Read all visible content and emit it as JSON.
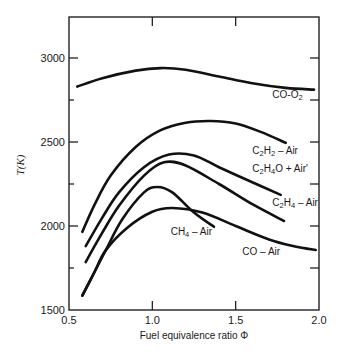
{
  "chart_data": {
    "type": "line",
    "title": "",
    "xlabel": "Fuel equivalence ratio Φ",
    "ylabel": "T(K)",
    "xlim": [
      0.5,
      2.0
    ],
    "ylim": [
      1500,
      3200
    ],
    "x_ticks": [
      {
        "value": 0.5,
        "label": "0.5"
      },
      {
        "value": 1.0,
        "label": "1.0"
      },
      {
        "value": 1.5,
        "label": "1.5"
      },
      {
        "value": 2.0,
        "label": "2.0"
      }
    ],
    "x_minor_ticks": [],
    "y_ticks": [
      {
        "value": 1500,
        "label": "1500"
      },
      {
        "value": 2000,
        "label": "2000"
      },
      {
        "value": 2500,
        "label": "2500"
      },
      {
        "value": 3000,
        "label": "3000"
      }
    ],
    "y_minor_ticks": [
      1750,
      2250,
      2750
    ],
    "grid": false,
    "legend": "none (curves labeled inline)",
    "series": [
      {
        "name": "CO-O₂",
        "label_parts": [
          [
            "CO-O",
            ""
          ],
          [
            "2",
            "sub"
          ]
        ],
        "label_at": [
          1.72,
          2760
        ],
        "points": [
          [
            0.55,
            2830
          ],
          [
            0.7,
            2880
          ],
          [
            0.9,
            2925
          ],
          [
            1.05,
            2940
          ],
          [
            1.2,
            2930
          ],
          [
            1.4,
            2890
          ],
          [
            1.6,
            2850
          ],
          [
            1.8,
            2822
          ],
          [
            1.97,
            2812
          ]
        ]
      },
      {
        "name": "C₂H₂ – Air",
        "label_parts": [
          [
            "C",
            ""
          ],
          [
            "2",
            "sub"
          ],
          [
            "H",
            ""
          ],
          [
            "2",
            "sub"
          ],
          [
            " – Air",
            ""
          ]
        ],
        "label_at": [
          1.6,
          2430
        ],
        "points": [
          [
            0.58,
            1965
          ],
          [
            0.65,
            2120
          ],
          [
            0.75,
            2300
          ],
          [
            0.9,
            2470
          ],
          [
            1.05,
            2570
          ],
          [
            1.2,
            2615
          ],
          [
            1.35,
            2625
          ],
          [
            1.5,
            2610
          ],
          [
            1.65,
            2560
          ],
          [
            1.8,
            2495
          ]
        ]
      },
      {
        "name": "C₂H₄O + Air'",
        "label_parts": [
          [
            "C",
            ""
          ],
          [
            "2",
            "sub"
          ],
          [
            "H",
            ""
          ],
          [
            "4",
            "sub"
          ],
          [
            "O + Air'",
            ""
          ]
        ],
        "label_at": [
          1.6,
          2320
        ],
        "points": [
          [
            0.6,
            1880
          ],
          [
            0.7,
            2050
          ],
          [
            0.8,
            2200
          ],
          [
            0.95,
            2350
          ],
          [
            1.1,
            2425
          ],
          [
            1.25,
            2420
          ],
          [
            1.4,
            2350
          ],
          [
            1.6,
            2260
          ],
          [
            1.77,
            2185
          ]
        ]
      },
      {
        "name": "C₂H₄ – Air",
        "label_parts": [
          [
            "C",
            ""
          ],
          [
            "2",
            "sub"
          ],
          [
            "H",
            ""
          ],
          [
            "4",
            "sub"
          ],
          [
            " – Air",
            ""
          ]
        ],
        "label_at": [
          1.72,
          2120
        ],
        "points": [
          [
            0.6,
            1785
          ],
          [
            0.7,
            1960
          ],
          [
            0.8,
            2120
          ],
          [
            0.95,
            2300
          ],
          [
            1.07,
            2380
          ],
          [
            1.2,
            2360
          ],
          [
            1.4,
            2250
          ],
          [
            1.6,
            2130
          ],
          [
            1.79,
            2030
          ]
        ]
      },
      {
        "name": "CH₄ – Air",
        "label_parts": [
          [
            "CH",
            ""
          ],
          [
            "4",
            "sub"
          ],
          [
            " – Air",
            ""
          ]
        ],
        "label_at": [
          1.11,
          1945
        ],
        "points": [
          [
            0.58,
            1585
          ],
          [
            0.65,
            1720
          ],
          [
            0.72,
            1855
          ],
          [
            0.82,
            2040
          ],
          [
            0.95,
            2200
          ],
          [
            1.03,
            2232
          ],
          [
            1.12,
            2200
          ],
          [
            1.25,
            2080
          ],
          [
            1.37,
            1995
          ]
        ]
      },
      {
        "name": "CO – Air",
        "label_parts": [
          [
            "CO – Air",
            ""
          ]
        ],
        "label_at": [
          1.54,
          1830
        ],
        "points": [
          [
            0.58,
            1585
          ],
          [
            0.65,
            1720
          ],
          [
            0.72,
            1855
          ],
          [
            0.85,
            1990
          ],
          [
            1.0,
            2085
          ],
          [
            1.12,
            2107
          ],
          [
            1.3,
            2080
          ],
          [
            1.5,
            2000
          ],
          [
            1.7,
            1920
          ],
          [
            1.85,
            1880
          ],
          [
            1.98,
            1857
          ]
        ]
      }
    ]
  }
}
